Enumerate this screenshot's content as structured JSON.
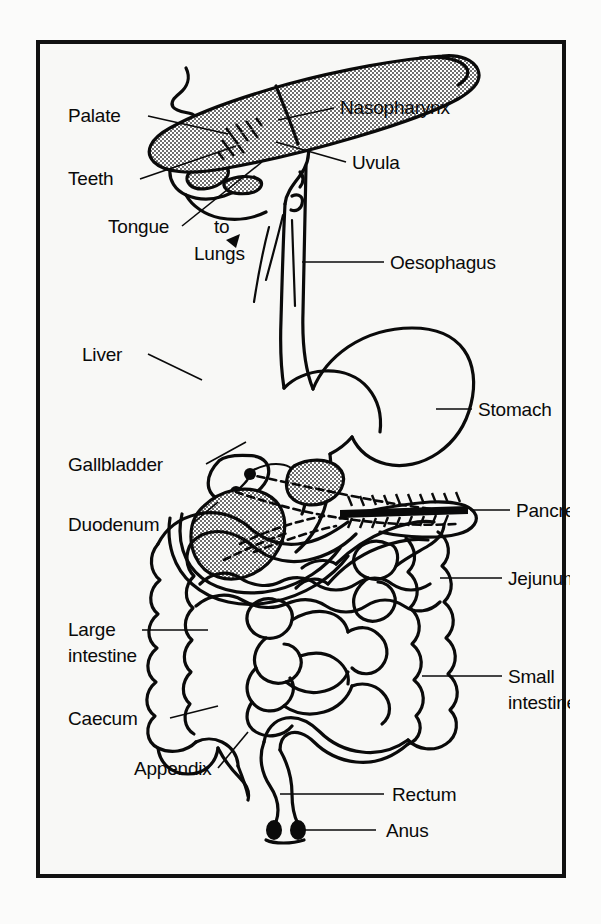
{
  "figure": {
    "caption": "The digestive system",
    "background_color": "#f8f8f6",
    "ink_color": "#0a0a0a",
    "frame_color": "#111111"
  },
  "labels": {
    "palate": "Palate",
    "teeth": "Teeth",
    "tongue": "Tongue",
    "to": "to",
    "lungs": "Lungs",
    "nasopharynx": "Nasopharynx",
    "uvula": "Uvula",
    "oesophagus": "Oesophagus",
    "liver": "Liver",
    "stomach": "Stomach",
    "gallbladder": "Gallbladder",
    "pancreas": "Pancreas",
    "duodenum": "Duodenum",
    "jejunum": "Jejunum",
    "large_intestine_line1": "Large",
    "large_intestine_line2": "intestine",
    "small_intestine_line1": "Small",
    "small_intestine_line2": "intestine",
    "caecum": "Caecum",
    "appendix": "Appendix",
    "rectum": "Rectum",
    "anus": "Anus"
  },
  "icons": {
    "lungs_arrow": "arrow-to-lungs-icon"
  }
}
